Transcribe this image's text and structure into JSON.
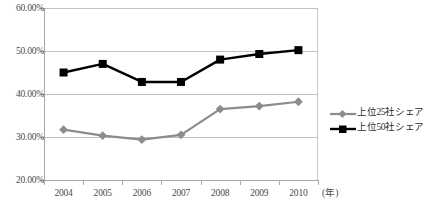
{
  "chart_data": {
    "type": "line",
    "title": "",
    "xlabel": "(年)",
    "ylabel": "",
    "categories": [
      "2004",
      "2005",
      "2006",
      "2007",
      "2008",
      "2009",
      "2010"
    ],
    "ylim": [
      20,
      60
    ],
    "ytick_values": [
      20,
      30,
      40,
      50,
      60
    ],
    "ytick_labels": [
      "20.00%",
      "30.00%",
      "40.00%",
      "50.00%",
      "60.00%"
    ],
    "grid": true,
    "legend_position": "right",
    "series": [
      {
        "name": "上位25社シェア",
        "color": "#8c8c8c",
        "marker": "diamond",
        "values": [
          31.7,
          30.3,
          29.4,
          30.5,
          36.5,
          37.2,
          38.2
        ]
      },
      {
        "name": "上位50社シェア",
        "color": "#000000",
        "marker": "square",
        "values": [
          45.0,
          47.0,
          42.8,
          42.8,
          48.0,
          49.3,
          50.2
        ]
      }
    ]
  },
  "axis": {
    "x_unit": "(年)"
  },
  "legend": {
    "items": [
      {
        "label": "上位25社シェア"
      },
      {
        "label": "上位50社シェア"
      }
    ]
  },
  "source_note": ""
}
